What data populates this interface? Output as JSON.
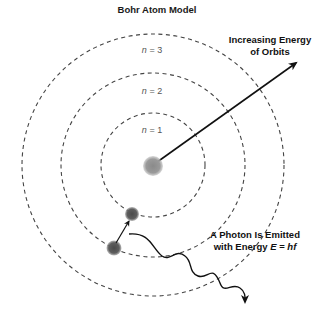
{
  "title": "Bohr Atom Model",
  "orbits": [
    {
      "label_var": "n",
      "label_eq": " = 1",
      "radius": 52
    },
    {
      "label_var": "n",
      "label_eq": " = 2",
      "radius": 92
    },
    {
      "label_var": "n",
      "label_eq": " = 3",
      "radius": 131
    }
  ],
  "energy_label": {
    "line1": "Increasing Energy",
    "line2": "of Orbits"
  },
  "photon_label": {
    "line1": "A Photon Is Emitted",
    "line2_prefix": "with Energy ",
    "line2_E": "E",
    "line2_eq": " = ",
    "line2_hf": "hf"
  },
  "colors": {
    "orbit": "#444444",
    "nucleus": "#888888",
    "electron": "#5a5a5a",
    "arrow": "#111111"
  }
}
